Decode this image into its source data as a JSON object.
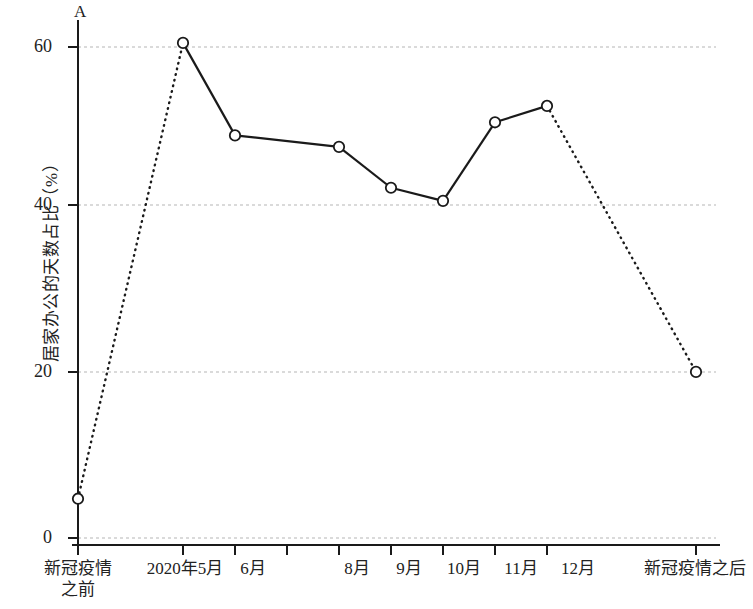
{
  "chart_data": {
    "type": "line",
    "title": "",
    "subtitle": "",
    "xlabel": "",
    "ylabel": "居家办公的天数占比（%）",
    "axis_marker": "A",
    "ylim": [
      0,
      65
    ],
    "yticks": [
      0,
      20,
      40,
      60
    ],
    "ytick_labels": [
      "0",
      "20",
      "40",
      "60"
    ],
    "grid": true,
    "grid_style": "dashed",
    "grid_color": "#b9b9b9",
    "legend": "none",
    "line_color": "#1a1a1a",
    "marker": "open-circle",
    "categories": [
      "新冠疫情之前",
      "2020年5月",
      "6月",
      "7月",
      "8月",
      "9月",
      "10月",
      "11月",
      "12月",
      "新冠疫情之后"
    ],
    "xtick_labels": [
      "新冠疫情\n之前",
      "2020年5月",
      "6月",
      "",
      "8月",
      "9月",
      "10月",
      "11月",
      "12月",
      "新冠疫情之后"
    ],
    "values": [
      4.8,
      60.5,
      49.2,
      null,
      47.8,
      42.8,
      41.2,
      50.8,
      52.8,
      20.3
    ],
    "segment_styles": [
      "dotted",
      "solid",
      "solid",
      "solid",
      "solid",
      "solid",
      "solid",
      "dotted"
    ],
    "points": [
      {
        "label": "新冠疫情之前",
        "value": 4.8
      },
      {
        "label": "2020年5月",
        "value": 60.5
      },
      {
        "label": "6月",
        "value": 49.2
      },
      {
        "label": "8月",
        "value": 47.8
      },
      {
        "label": "9月",
        "value": 42.8
      },
      {
        "label": "10月",
        "value": 41.2
      },
      {
        "label": "11月",
        "value": 50.8
      },
      {
        "label": "12月",
        "value": 52.8
      },
      {
        "label": "新冠疫情之后",
        "value": 20.3
      }
    ]
  },
  "xlabels": {
    "t0_line1": "新冠疫情",
    "t0_line2": "之前",
    "t1": "2020年5月",
    "t2": "6月",
    "t4": "8月",
    "t5": "9月",
    "t6": "10月",
    "t7": "11月",
    "t8": "12月",
    "t9": "新冠疫情之后"
  },
  "ylabels": {
    "y0": "0",
    "y20": "20",
    "y40": "40",
    "y60": "60"
  },
  "axis": {
    "marker": "A",
    "y_title": "居家办公的天数占比（%）"
  }
}
